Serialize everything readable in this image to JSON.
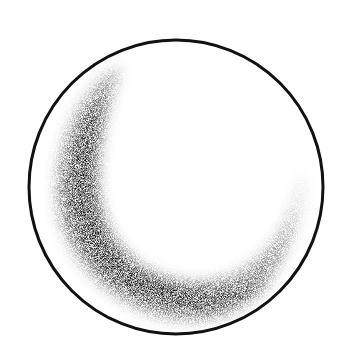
{
  "figure": {
    "description": "Pencil drawing of a sphere outline with a dark crescent-shaped shaded region along the lower-left interior",
    "background": "#ffffff",
    "outline_color": "#111111",
    "shade_color": "#1a1a1a",
    "circle": {
      "cx": 176,
      "cy": 187,
      "r": 147
    },
    "crescent": {
      "top_tip": [
        118,
        68
      ],
      "right_tip": [
        302,
        172
      ]
    }
  }
}
